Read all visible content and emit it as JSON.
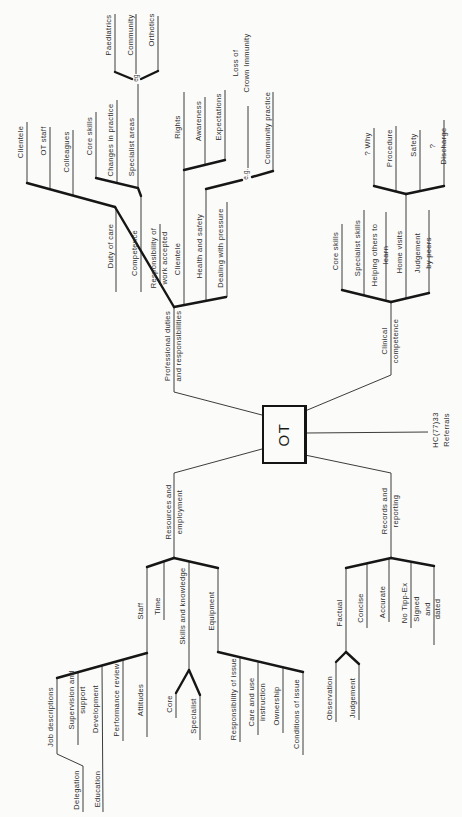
{
  "figure": {
    "type": "mindmap",
    "orientation": "labels rotated 90deg counter-clockwise"
  },
  "mindmap": {
    "center": "OT",
    "branches": [
      {
        "label": "Professional duties\nand responsibilities",
        "children": [
          {
            "label": "Duty of care",
            "children": [
              {
                "label": "Clientele"
              },
              {
                "label": "OT staff"
              },
              {
                "label": "Colleagues"
              }
            ]
          },
          {
            "label": "Competence",
            "children": [
              {
                "label": "Core skills"
              },
              {
                "label": "Changes in practice"
              },
              {
                "label": "Specialist areas",
                "children": [
                  {
                    "label": "eg",
                    "children": [
                      {
                        "label": "Paediatrics"
                      },
                      {
                        "label": "Community"
                      },
                      {
                        "label": "Orthotics"
                      }
                    ]
                  }
                ]
              }
            ]
          },
          {
            "label": "Responsibility of\nwork accepted"
          },
          {
            "label": "Clientele",
            "children": [
              {
                "label": "Rights"
              },
              {
                "label": "Awareness"
              },
              {
                "label": "Expectations"
              }
            ]
          },
          {
            "label": "Health and safety",
            "children": [
              {
                "label": "e.g.",
                "children": [
                  {
                    "label": "Loss of\nCrown Immunity"
                  },
                  {
                    "label": "Community practice"
                  }
                ]
              }
            ]
          },
          {
            "label": "Dealing with pressure"
          }
        ]
      },
      {
        "label": "Clinical\ncompetence",
        "children": [
          {
            "label": "Core skills"
          },
          {
            "label": "Specialist skills"
          },
          {
            "label": "Helping others to learn"
          },
          {
            "label": "Home visits",
            "children": [
              {
                "label": "? Why"
              },
              {
                "label": "Procedure"
              },
              {
                "label": "Safety"
              },
              {
                "label": "? Discharge"
              }
            ]
          },
          {
            "label": "Judgement by peers"
          }
        ]
      },
      {
        "label": "HC(77)33 Referrals"
      },
      {
        "label": "Resources and\nemployment",
        "children": [
          {
            "label": "Staff",
            "children": [
              {
                "label": "Job descriptions",
                "children": [
                  {
                    "label": "Delegation"
                  }
                ]
              },
              {
                "label": "Supervision and\nsupport"
              },
              {
                "label": "Development",
                "children": [
                  {
                    "label": "Education"
                  }
                ]
              },
              {
                "label": "Performance review"
              },
              {
                "label": "Attitudes"
              }
            ]
          },
          {
            "label": "Time"
          },
          {
            "label": "Skills and knowledge",
            "children": [
              {
                "label": "Core"
              },
              {
                "label": "Specialist"
              }
            ]
          },
          {
            "label": "Equipment",
            "children": [
              {
                "label": "Responsibility of issue"
              },
              {
                "label": "Care and use\ninstruction"
              },
              {
                "label": "Ownership"
              },
              {
                "label": "Conditions of issue"
              }
            ]
          }
        ]
      },
      {
        "label": "Records and\nreporting",
        "children": [
          {
            "label": "Factual",
            "children": [
              {
                "label": "Observation"
              },
              {
                "label": "Judgement"
              }
            ]
          },
          {
            "label": "Concise"
          },
          {
            "label": "Accurate"
          },
          {
            "label": "No Tipp-Ex"
          },
          {
            "label": "Signed and dated"
          }
        ]
      }
    ]
  }
}
